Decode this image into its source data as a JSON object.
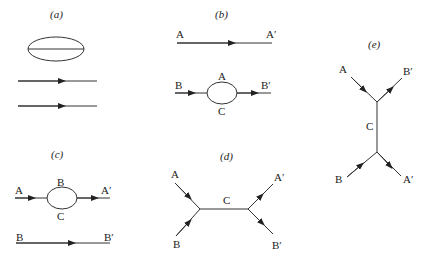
{
  "panels": {
    "a": {
      "label": "(a)"
    },
    "b": {
      "label": "(b)",
      "top": {
        "start": "A",
        "end": "A′"
      },
      "bottom": {
        "start": "B",
        "end": "B′",
        "loop_top": "A",
        "loop_bottom": "C"
      }
    },
    "c": {
      "label": "(c)",
      "top": {
        "start": "A",
        "end": "A′",
        "loop_top": "B",
        "loop_bottom": "C"
      },
      "bottom": {
        "start": "B",
        "end": "B′"
      }
    },
    "d": {
      "label": "(d)",
      "in_top": "A",
      "in_bottom": "B",
      "mid": "C",
      "out_top": "A′",
      "out_bottom": "B′"
    },
    "e": {
      "label": "(e)",
      "in_top": "A",
      "out_top": "B′",
      "mid": "C",
      "in_bottom": "B",
      "out_bottom": "A′"
    }
  }
}
